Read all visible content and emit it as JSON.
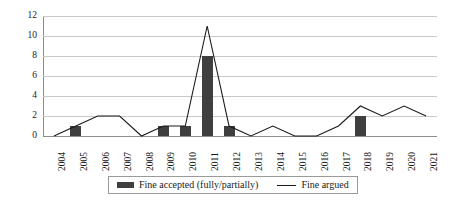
{
  "chart_data": {
    "type": "bar",
    "title": "",
    "subtitle": "",
    "xlabel": "",
    "ylabel": "",
    "categories": [
      "2004",
      "2005",
      "2006",
      "2007",
      "2008",
      "2009",
      "2010",
      "2011",
      "2012",
      "2013",
      "2014",
      "2015",
      "2016",
      "2017",
      "2018",
      "2019",
      "2020",
      "2021"
    ],
    "series": [
      {
        "name": "Fine accepted (fully/partially)",
        "type": "bar",
        "color": "#3f3f3f",
        "values": [
          0,
          1,
          0,
          0,
          0,
          1,
          1,
          8,
          1,
          0,
          0,
          0,
          0,
          0,
          2,
          0,
          0,
          0
        ]
      },
      {
        "name": "Fine argued",
        "type": "line",
        "color": "#1a1a1a",
        "values": [
          0,
          1,
          2,
          2,
          0,
          1,
          1,
          11,
          1,
          0,
          1,
          0,
          0,
          1,
          3,
          2,
          3,
          2
        ]
      }
    ],
    "ylim": [
      0,
      12
    ],
    "yticks": [
      0,
      2,
      4,
      6,
      8,
      10,
      12
    ],
    "ytick_labels": [
      "0",
      "2",
      "4",
      "6",
      "8",
      "10",
      "12"
    ],
    "grid": true,
    "legend_position": "bottom"
  },
  "legend": {
    "entries": [
      {
        "label": "Fine accepted (fully/partially)",
        "marker": "bar-swatch"
      },
      {
        "label": "Fine argued",
        "marker": "line-swatch"
      }
    ]
  }
}
